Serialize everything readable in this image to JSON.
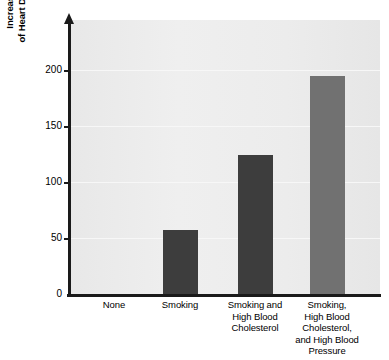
{
  "chart_data": {
    "type": "bar",
    "title": "",
    "xlabel": "",
    "ylabel": "Increase in the Risk of Heart Disease (percent)",
    "ylabel_lines": [
      "Increase in the Risk",
      "of Heart Disease (percent)"
    ],
    "categories": [
      "None",
      "Smoking",
      "Smoking and High Blood Cholesterol",
      "Smoking, High Blood Cholesterol, and High Blood Pressure"
    ],
    "category_lines": [
      [
        "None"
      ],
      [
        "Smoking"
      ],
      [
        "Smoking and",
        "High Blood",
        "Cholesterol"
      ],
      [
        "Smoking,",
        "High Blood",
        "Cholesterol,",
        "and High Blood",
        "Pressure"
      ]
    ],
    "values": [
      0,
      57,
      124,
      195
    ],
    "ylim": [
      0,
      215
    ],
    "yticks": [
      0,
      50,
      100,
      150,
      200
    ],
    "ytick_labels": [
      "0",
      "50",
      "100",
      "150",
      "200"
    ],
    "grid": true,
    "legend": "none",
    "bar_colors": [
      "#ececec",
      "#3d3d3d",
      "#3d3d3d",
      "#717171"
    ],
    "plot_background": "#ececec",
    "axis_color": "#1a1a1a"
  }
}
